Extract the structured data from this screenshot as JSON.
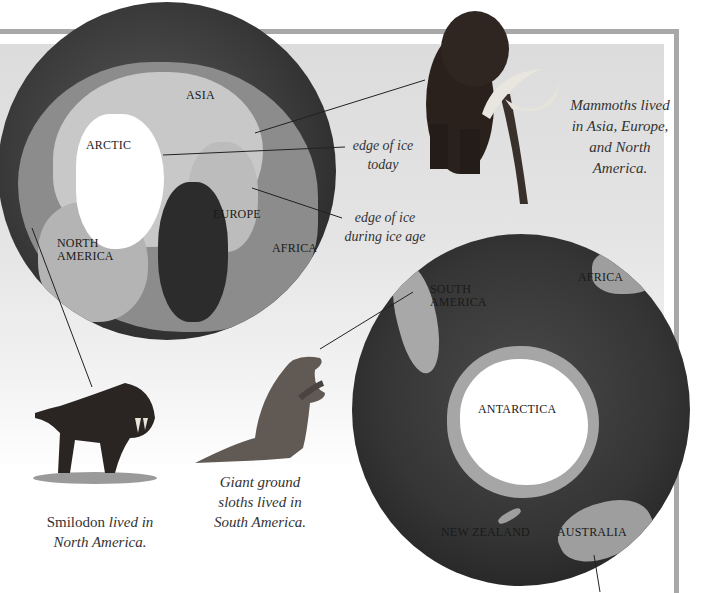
{
  "page": {
    "frame_color": "#a8a8a8",
    "panel_color": "#dcdcdc"
  },
  "northern_globe": {
    "labels": {
      "asia": "ASIA",
      "arctic": "ARCTIC",
      "europe": "EUROPE",
      "north_america": "NORTH AMERICA",
      "africa": "AFRICA"
    },
    "annotations": {
      "edge_today": "edge of ice today",
      "edge_ice_age": "edge of ice during ice age"
    }
  },
  "southern_globe": {
    "labels": {
      "south_america": "SOUTH AMERICA",
      "africa": "AFRICA",
      "antarctica": "ANTARCTICA",
      "new_zealand": "NEW ZEALAND",
      "australia": "AUSTRALIA"
    }
  },
  "captions": {
    "mammoth": "Mammoths lived in Asia, Europe, and North America.",
    "smilodon_name": "Smilodon",
    "smilodon_rest": " lived in North America.",
    "sloth": "Giant ground sloths lived in South America."
  },
  "animals": {
    "mammoth": "woolly mammoth",
    "smilodon": "smilodon",
    "sloth": "giant ground sloth"
  }
}
